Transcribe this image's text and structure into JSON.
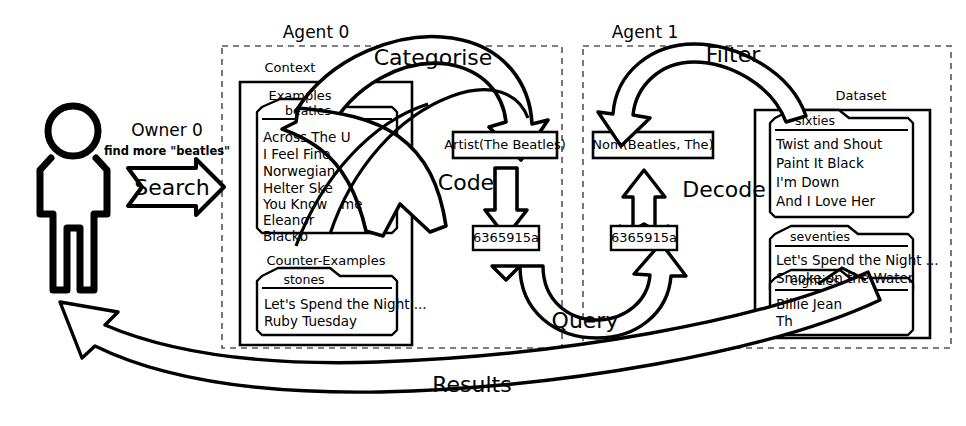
{
  "diagram": {
    "title_hidden": "",
    "background": "#ffffff",
    "stroke": "#000000"
  },
  "actor": {
    "name": "person-figure",
    "owner_label": "Owner 0",
    "owner_request": "find more \"beatles\"",
    "search_arrow_label": "Search"
  },
  "agent0": {
    "title": "Agent 0",
    "context_label": "Context",
    "examples_label": "Examples",
    "examples_tab": "beatles",
    "examples_items": [
      "Across The U",
      "I Feel Fine",
      "Norwegian",
      "Helter Ske",
      "You Know",
      "Eleanor",
      "Blackb"
    ],
    "examples_item_fragment": "me",
    "counter_examples_label": "Counter-Examples",
    "counter_tab": "stones",
    "counter_items": [
      "Let's Spend the Night ...",
      "Ruby Tuesday"
    ],
    "artist_box": "Artist(The Beatles)",
    "code_label": "Code",
    "hash_box": "6365915a",
    "categorise_label": "Categorise"
  },
  "agent1": {
    "title": "Agent 1",
    "filter_label": "Filter",
    "nom_box": "Nom(Beatles, The)",
    "decode_label": "Decode",
    "hash_box": "6365915a",
    "dataset_label": "Dataset",
    "groups": [
      {
        "tab": "sixties",
        "items": [
          "Twist and Shout",
          "Paint It Black",
          "I'm Down",
          "And I Love Her"
        ]
      },
      {
        "tab": "seventies",
        "items": [
          "Let's Spend the Night ...",
          "Smoke on the Water"
        ]
      },
      {
        "tab": "eighties",
        "items": [
          "Billie Jean",
          "Th"
        ]
      }
    ]
  },
  "flows": {
    "query_label": "Query",
    "results_label": "Results"
  }
}
